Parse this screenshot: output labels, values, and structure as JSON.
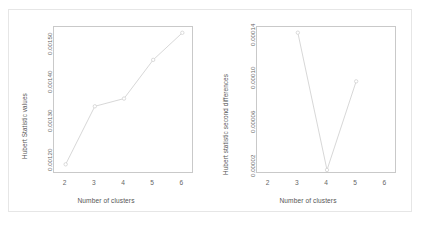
{
  "figure": {
    "background_color": "#ffffff",
    "frame_color": "#e6e6e6",
    "axis_color": "#c9c9c9",
    "series_color": "#d2d2d2",
    "text_color": "#555555"
  },
  "chart_data": [
    {
      "type": "line",
      "title": "",
      "xlabel": "Number of clusters",
      "ylabel": "Hubert Statistic values",
      "x": [
        2,
        3,
        4,
        5,
        6
      ],
      "values": [
        0.00118,
        0.00133,
        0.00135,
        0.00145,
        0.00152
      ],
      "series": [
        {
          "name": "Hubert Statistic values",
          "values": [
            0.00118,
            0.00133,
            0.00135,
            0.00145,
            0.00152
          ]
        }
      ],
      "xlim": [
        1.6,
        6.4
      ],
      "ylim": [
        0.001155,
        0.001535
      ],
      "xticks": [
        2,
        3,
        4,
        5,
        6
      ],
      "xticklabels": [
        "2",
        "3",
        "4",
        "5",
        "6"
      ],
      "yticks": [
        0.0012,
        0.0013,
        0.0014,
        0.0015
      ],
      "yticklabels": [
        "0.00120",
        "0.00130",
        "0.00140",
        "0.00150"
      ],
      "grid": false,
      "legend": false,
      "marker": "open-circle",
      "ytick_rotation": 90,
      "ylabel_rotation": 90
    },
    {
      "type": "line",
      "title": "",
      "xlabel": "Number of clusters",
      "ylabel": "Hubert statistic second differences",
      "x": [
        3,
        4,
        5
      ],
      "values": [
        0.000139,
        1.35e-05,
        9.45e-05
      ],
      "series": [
        {
          "name": "Hubert statistic second differences",
          "values": [
            0.000139,
            1.35e-05,
            9.45e-05
          ]
        }
      ],
      "xlim": [
        1.6,
        6.4
      ],
      "ylim": [
        9.8e-06,
        0.0001442
      ],
      "xticks": [
        2,
        3,
        4,
        5,
        6
      ],
      "xticklabels": [
        "2",
        "3",
        "4",
        "5",
        "6"
      ],
      "yticks": [
        2e-05,
        6e-05,
        0.0001,
        0.00014
      ],
      "yticklabels": [
        "0.00002",
        "0.00006",
        "0.00010",
        "0.00014"
      ],
      "grid": false,
      "legend": false,
      "marker": "open-circle",
      "ytick_rotation": 90,
      "ylabel_rotation": 90
    }
  ]
}
